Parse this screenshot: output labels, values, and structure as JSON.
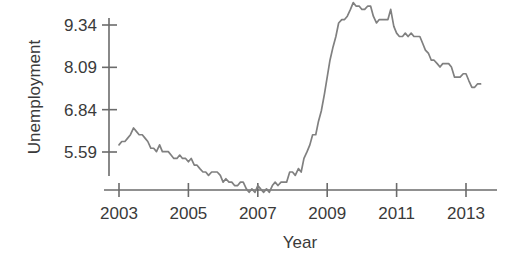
{
  "chart_data": {
    "type": "line",
    "title": "",
    "xlabel": "Year",
    "ylabel": "Unemployment",
    "xlim": [
      2003.0,
      2013.5
    ],
    "ylim": [
      4.2,
      10.25
    ],
    "grid": false,
    "legend": "none",
    "line_color": "#808080",
    "axis_color": "#6b6b6b",
    "xticks": [
      2003,
      2005,
      2007,
      2009,
      2011,
      2013
    ],
    "xticklabels": [
      "2003",
      "2005",
      "2007",
      "2009",
      "2011",
      "2013"
    ],
    "yticks": [
      5.59,
      6.84,
      8.09,
      9.34
    ],
    "yticklabels": [
      "5.59",
      "6.84",
      "8.09",
      "9.34"
    ],
    "series": [
      {
        "name": "Unemployment",
        "x": [
          2003.0,
          2003.08,
          2003.17,
          2003.25,
          2003.33,
          2003.42,
          2003.5,
          2003.58,
          2003.67,
          2003.75,
          2003.83,
          2003.92,
          2004.0,
          2004.08,
          2004.17,
          2004.25,
          2004.33,
          2004.42,
          2004.5,
          2004.58,
          2004.67,
          2004.75,
          2004.83,
          2004.92,
          2005.0,
          2005.08,
          2005.17,
          2005.25,
          2005.33,
          2005.42,
          2005.5,
          2005.58,
          2005.67,
          2005.75,
          2005.83,
          2005.92,
          2006.0,
          2006.08,
          2006.17,
          2006.25,
          2006.33,
          2006.42,
          2006.5,
          2006.58,
          2006.67,
          2006.75,
          2006.83,
          2006.92,
          2007.0,
          2007.08,
          2007.17,
          2007.25,
          2007.33,
          2007.42,
          2007.5,
          2007.58,
          2007.67,
          2007.75,
          2007.83,
          2007.92,
          2008.0,
          2008.08,
          2008.17,
          2008.25,
          2008.33,
          2008.42,
          2008.5,
          2008.58,
          2008.67,
          2008.75,
          2008.83,
          2008.92,
          2009.0,
          2009.08,
          2009.17,
          2009.25,
          2009.33,
          2009.42,
          2009.5,
          2009.58,
          2009.67,
          2009.75,
          2009.83,
          2009.92,
          2010.0,
          2010.08,
          2010.17,
          2010.25,
          2010.33,
          2010.42,
          2010.5,
          2010.58,
          2010.67,
          2010.75,
          2010.83,
          2010.92,
          2011.0,
          2011.08,
          2011.17,
          2011.25,
          2011.33,
          2011.42,
          2011.5,
          2011.58,
          2011.67,
          2011.75,
          2011.83,
          2011.92,
          2012.0,
          2012.08,
          2012.17,
          2012.25,
          2012.33,
          2012.42,
          2012.5,
          2012.58,
          2012.67,
          2012.75,
          2012.83,
          2012.92,
          2013.0,
          2013.08,
          2013.17,
          2013.25,
          2013.33,
          2013.42
        ],
        "values": [
          5.8,
          5.9,
          5.9,
          6.0,
          6.1,
          6.3,
          6.2,
          6.1,
          6.1,
          6.0,
          5.9,
          5.7,
          5.7,
          5.6,
          5.8,
          5.6,
          5.6,
          5.6,
          5.5,
          5.4,
          5.4,
          5.5,
          5.4,
          5.4,
          5.3,
          5.4,
          5.2,
          5.2,
          5.1,
          5.0,
          5.0,
          4.9,
          5.0,
          5.0,
          5.0,
          4.9,
          4.7,
          4.8,
          4.7,
          4.7,
          4.6,
          4.6,
          4.7,
          4.7,
          4.5,
          4.4,
          4.5,
          4.4,
          4.6,
          4.5,
          4.4,
          4.5,
          4.4,
          4.6,
          4.7,
          4.6,
          4.7,
          4.7,
          4.7,
          5.0,
          5.0,
          4.9,
          5.1,
          5.0,
          5.4,
          5.6,
          5.8,
          6.1,
          6.1,
          6.5,
          6.8,
          7.3,
          7.8,
          8.3,
          8.7,
          9.0,
          9.4,
          9.5,
          9.5,
          9.6,
          9.8,
          10.0,
          9.9,
          9.9,
          9.8,
          9.8,
          9.9,
          9.9,
          9.6,
          9.4,
          9.5,
          9.5,
          9.5,
          9.5,
          9.8,
          9.3,
          9.1,
          9.0,
          9.0,
          9.1,
          9.0,
          9.1,
          9.0,
          9.0,
          9.0,
          8.8,
          8.6,
          8.5,
          8.3,
          8.3,
          8.2,
          8.1,
          8.2,
          8.2,
          8.2,
          8.1,
          7.8,
          7.8,
          7.8,
          7.9,
          7.9,
          7.7,
          7.5,
          7.5,
          7.6,
          7.6
        ]
      }
    ]
  },
  "labels": {
    "y_axis_title": "Unemployment",
    "x_axis_title": "Year"
  }
}
